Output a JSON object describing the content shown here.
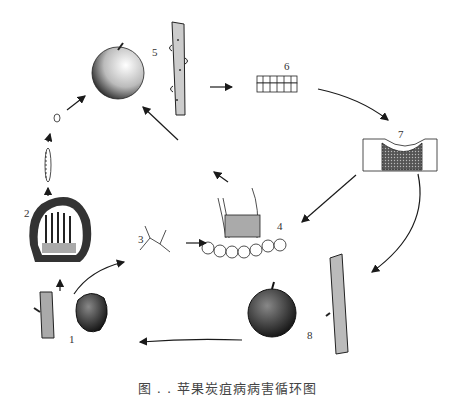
{
  "diagram": {
    "type": "disease-cycle",
    "caption": "图 . .  苹果炭疽病病害循环图",
    "stages": [
      {
        "id": "1",
        "label": "1",
        "description": "mummified fruit and infected twig (overwintering)"
      },
      {
        "id": "2",
        "label": "2",
        "description": "acervulus with conidiophores in cross-section"
      },
      {
        "id": "3",
        "label": "3",
        "description": "germinating conidia"
      },
      {
        "id": "4",
        "label": "4",
        "description": "acervulus on host tissue with setae"
      },
      {
        "id": "5",
        "label": "5",
        "description": "infected twig"
      },
      {
        "id": "6",
        "label": "6",
        "description": "host epidermis tissue"
      },
      {
        "id": "7",
        "label": "7",
        "description": "lesion in tissue cross-section"
      },
      {
        "id": "8",
        "label": "8",
        "description": "rotted fruit and infected twig"
      }
    ],
    "colors": {
      "ink": "#1a1a1a",
      "background": "#ffffff"
    }
  }
}
